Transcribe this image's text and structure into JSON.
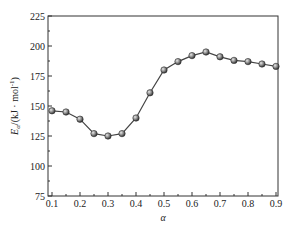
{
  "chart_data": {
    "type": "line",
    "title": "",
    "xlabel": "α",
    "ylabel": "E_α/(kJ·mol⁻¹)",
    "ylabel_parts": {
      "main": "E",
      "sub": "α",
      "unit": "/(kJ · mol",
      "sup": "-1",
      "close": ")"
    },
    "xlim": [
      0.1,
      0.9
    ],
    "ylim": [
      75,
      225
    ],
    "x_ticks": [
      "0.1",
      "0.2",
      "0.3",
      "0.4",
      "0.5",
      "0.6",
      "0.7",
      "0.8",
      "0.9"
    ],
    "y_ticks": [
      "75",
      "100",
      "125",
      "150",
      "175",
      "200",
      "225"
    ],
    "grid": false,
    "legend": null,
    "series": [
      {
        "name": "Eα",
        "marker": "sphere",
        "color": "#555555",
        "x": [
          0.1,
          0.15,
          0.2,
          0.25,
          0.3,
          0.35,
          0.4,
          0.45,
          0.5,
          0.55,
          0.6,
          0.65,
          0.7,
          0.75,
          0.8,
          0.85,
          0.9
        ],
        "values": [
          146,
          145,
          139,
          127,
          125,
          127,
          140,
          161,
          180,
          187,
          192,
          195,
          191,
          188,
          187,
          185,
          183
        ]
      }
    ]
  }
}
